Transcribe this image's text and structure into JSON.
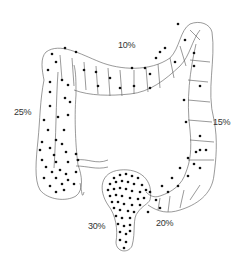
{
  "diagram": {
    "labels": {
      "transverse": "10%",
      "ascending": "25%",
      "descending": "15%",
      "sigmoid": "20%",
      "rectum": "30%"
    },
    "colors": {
      "outline": "#555555",
      "dots": "#111111",
      "text": "#333333",
      "background": "#ffffff"
    }
  }
}
